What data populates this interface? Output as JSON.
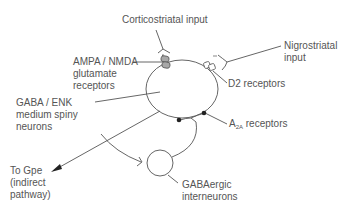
{
  "labels": {
    "corticostriatal": "Corticostriatal input",
    "ampa_line1": "AMPA / NMDA",
    "ampa_line2": "glutamate",
    "ampa_line3": "receptors",
    "nigro_line1": "Nigrostriatal",
    "nigro_line2": "input",
    "d2": "D2 receptors",
    "gaba_line1": "GABA / ENK",
    "gaba_line2": "medium spiny",
    "gaba_line3": "neurons",
    "a2a_main": "A",
    "a2a_sub": "2A",
    "a2a_rest": " receptors",
    "gpe_line1": "To Gpe",
    "gpe_line2": "(indirect",
    "gpe_line3": "pathway)",
    "interneuron_line1": "GABAergic",
    "interneuron_line2": "interneurons"
  },
  "colors": {
    "line": "#555555",
    "glutamate_receptor_fill": "#a8a8a8",
    "d2_receptor_fill": "#ffffff",
    "a2a_dot": "#222222"
  }
}
